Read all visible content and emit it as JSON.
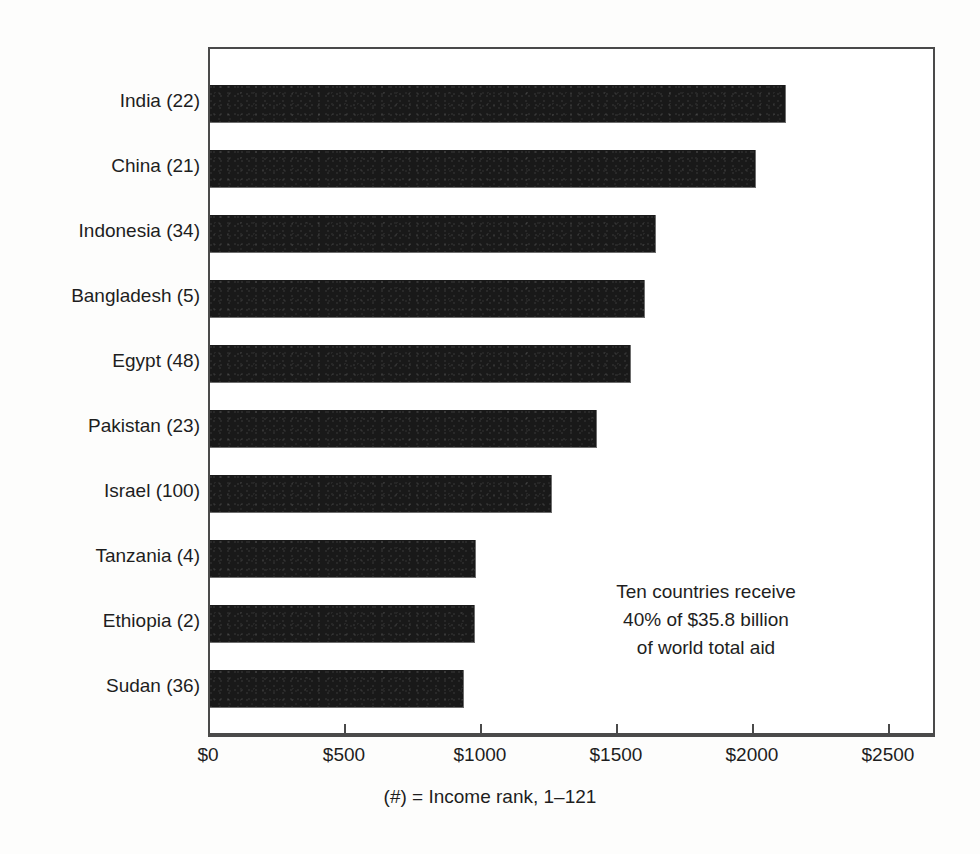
{
  "chart_data": {
    "type": "bar",
    "orientation": "horizontal",
    "title": "",
    "xlabel": "",
    "ylabel": "",
    "xlim": [
      0,
      2673
    ],
    "xticks": [
      0,
      500,
      1000,
      1500,
      2000,
      2500
    ],
    "xtick_labels": [
      "$0",
      "$500",
      "$1000",
      "$1500",
      "$2000",
      "$2500"
    ],
    "grid": false,
    "legend": null,
    "categories": [
      "India (22)",
      "China (21)",
      "Indonesia (34)",
      "Bangladesh (5)",
      "Egypt (48)",
      "Pakistan (23)",
      "Israel (100)",
      "Tanzania (4)",
      "Ethiopia (2)",
      "Sudan (36)"
    ],
    "country_names": [
      "India",
      "China",
      "Indonesia",
      "Bangladesh",
      "Egypt",
      "Pakistan",
      "Israel",
      "Tanzania",
      "Ethiopia",
      "Sudan"
    ],
    "income_ranks": [
      22,
      21,
      34,
      5,
      48,
      23,
      100,
      4,
      2,
      36
    ],
    "values": [
      2113,
      2003,
      1635,
      1595,
      1543,
      1418,
      1252,
      976,
      972,
      931
    ],
    "bar_color": "#191919",
    "annotations": [
      "Ten countries receive",
      "40% of $35.8 billion",
      "of world total aid"
    ],
    "caption": "(#) = Income rank, 1–121"
  },
  "colors": {
    "bar": "#191919",
    "frame": "#4a4a4a",
    "text": "#1e1e1e",
    "background": "#fdfdfc"
  }
}
